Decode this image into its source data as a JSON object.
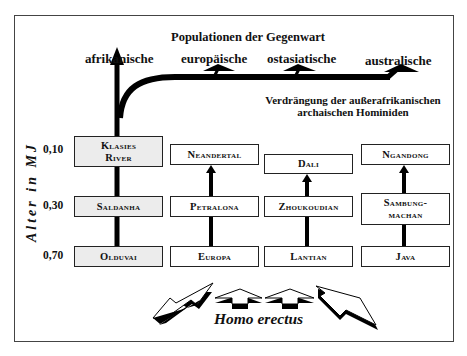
{
  "diagram": {
    "title": "Populationen der Gegenwart",
    "present_populations": [
      {
        "label": "afrikanische"
      },
      {
        "label": "europäische"
      },
      {
        "label": "ostasiatische"
      },
      {
        "label": "australische"
      }
    ],
    "annotation": {
      "line1": "Verdrängung der außerafrikanischen",
      "line2": "archaischen Hominiden"
    },
    "y_axis": {
      "label": "Alter in MJ",
      "ticks": [
        "0,10",
        "0,30",
        "0,70"
      ]
    },
    "columns": [
      {
        "region": "africa",
        "shaded": true,
        "sites": [
          "Klasies River",
          "Saldanha",
          "Olduvai"
        ]
      },
      {
        "region": "europe",
        "shaded": false,
        "sites": [
          "Neandertal",
          "Petralona",
          "Europa"
        ]
      },
      {
        "region": "east-asia",
        "shaded": false,
        "sites": [
          "Dali",
          "Zhoukoudian",
          "Lantian"
        ]
      },
      {
        "region": "australasia",
        "shaded": false,
        "sites": [
          "Ngandong",
          "Sambung-machan",
          "Java"
        ]
      }
    ],
    "origin_label": "Homo erectus",
    "colors": {
      "line": "#000000",
      "box_border": "#222222",
      "africa_fill": "#ececec",
      "frame": "#444444"
    }
  }
}
